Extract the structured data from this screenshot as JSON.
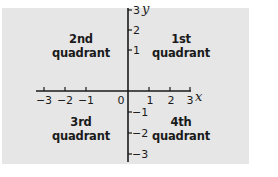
{
  "diagram": {
    "type": "coordinate-plane-quadrants",
    "colors": {
      "background": "#e6e6e6",
      "axis": "#1a1a1a",
      "text": "#1a1a1a"
    },
    "axes": {
      "x_label": "x",
      "y_label": "y",
      "origin_label": "0",
      "x_ticks": [
        {
          "value": -3,
          "label": "−3"
        },
        {
          "value": -2,
          "label": "−2"
        },
        {
          "value": -1,
          "label": "−1"
        },
        {
          "value": 1,
          "label": "1"
        },
        {
          "value": 2,
          "label": "2"
        },
        {
          "value": 3,
          "label": "3"
        }
      ],
      "y_ticks": [
        {
          "value": 3,
          "label": "3"
        },
        {
          "value": 2,
          "label": "2"
        },
        {
          "value": 1,
          "label": "1"
        },
        {
          "value": -1,
          "label": "−1"
        },
        {
          "value": -2,
          "label": "−2"
        },
        {
          "value": -3,
          "label": "−3"
        }
      ]
    },
    "quadrants": {
      "first": {
        "line1": "1st",
        "line2": "quadrant"
      },
      "second": {
        "line1": "2nd",
        "line2": "quadrant"
      },
      "third": {
        "line1": "3rd",
        "line2": "quadrant"
      },
      "fourth": {
        "line1": "4th",
        "line2": "quadrant"
      }
    }
  }
}
